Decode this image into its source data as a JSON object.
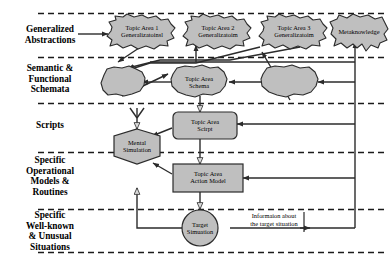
{
  "diagram": {
    "colors": {
      "fill": "#bfbfbf",
      "stroke": "#2b2b2b",
      "divider": "#1a1a1a",
      "background": "#ffffff",
      "text": "#000000"
    },
    "tiers": [
      {
        "id": "generalized-abstractions",
        "label": "Generalized\nAbstractions"
      },
      {
        "id": "semantic-functional-schemata",
        "label": "Semantic &\nFunctional\nSchemata"
      },
      {
        "id": "scripts",
        "label": "Scripts"
      },
      {
        "id": "specific-operational-models",
        "label": "Specific\nOperational\nModels &\nRoutines"
      },
      {
        "id": "specific-situations",
        "label": "Specific\nWell-known\n& Unusual\nSituations"
      }
    ],
    "nodes": {
      "cloud_topic1": {
        "label": "Topic Area 1\nGeneralizatoinsl",
        "shape": "cloud"
      },
      "cloud_topic2": {
        "label": "Topic Area 2\nGeneralizatoim",
        "shape": "cloud"
      },
      "cloud_topic3": {
        "label": "Topic Area 3\nGeneralizatoim",
        "shape": "cloud"
      },
      "cloud_metaknowledge": {
        "label": "Metaknowledge",
        "shape": "cloud"
      },
      "cloud_schema_left": {
        "label": "",
        "shape": "cloud"
      },
      "cloud_schema_center": {
        "label": "Topic Area\nSchema",
        "shape": "cloud"
      },
      "cloud_schema_right": {
        "label": "",
        "shape": "cloud"
      },
      "box_script": {
        "label": "Topic Area\nScirpt",
        "shape": "rounded-rect"
      },
      "hex_mental_simulation": {
        "label": "Mental\nSimulation",
        "shape": "hexagon"
      },
      "box_action_model": {
        "label": "Topic Area\nAction Model",
        "shape": "rect"
      },
      "circle_target_situation": {
        "label": "Target\nSimuation",
        "shape": "circle"
      }
    },
    "annotations": {
      "info_about_target": "Informaion about\nthe target situation"
    }
  }
}
